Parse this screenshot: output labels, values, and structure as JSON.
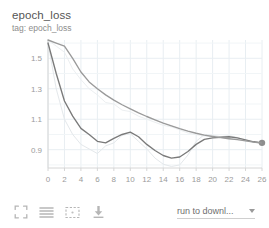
{
  "header": {
    "title": "epoch_loss",
    "subtitle": "tag: epoch_loss"
  },
  "toolbar": {
    "fullscreen_label": "fullscreen-icon",
    "lines_label": "horizontal-lines-icon",
    "fit_label": "fit-domain-icon",
    "download_label": "download-icon",
    "run_selector_label": "run to downl...",
    "caret_label": "chevron-down-icon"
  },
  "colors": {
    "series_dark": "#7a7a7a",
    "series_light": "#9a9a9a",
    "unsmoothed": "#e2e6ea",
    "grid": "#e8eef2",
    "axis_text": "#9b9b9b",
    "title": "#555555",
    "subtitle": "#8d8d8d"
  },
  "chart_data": {
    "type": "line",
    "title": "epoch_loss",
    "xlabel": "",
    "ylabel": "",
    "xlim": [
      0,
      26
    ],
    "ylim": [
      0.78,
      1.62
    ],
    "grid": true,
    "legend_position": "none",
    "xticks": [
      0,
      2,
      4,
      6,
      8,
      10,
      12,
      14,
      16,
      18,
      20,
      22,
      24,
      26
    ],
    "yticks": [
      0.9,
      1.1,
      1.3,
      1.5
    ],
    "x": [
      0,
      1,
      2,
      3,
      4,
      5,
      6,
      7,
      8,
      9,
      10,
      11,
      12,
      13,
      14,
      15,
      16,
      17,
      18,
      19,
      20,
      21,
      22,
      23,
      24,
      25,
      26
    ],
    "series": [
      {
        "name": "train",
        "color": "#7a7a7a",
        "smoothed": true,
        "endpoint_marker": true,
        "values": [
          1.6,
          1.4,
          1.22,
          1.12,
          1.04,
          1.0,
          0.955,
          0.945,
          0.975,
          1.0,
          1.015,
          0.985,
          0.935,
          0.895,
          0.862,
          0.845,
          0.852,
          0.888,
          0.935,
          0.968,
          0.978,
          0.982,
          0.985,
          0.978,
          0.965,
          0.952,
          0.945
        ]
      },
      {
        "name": "validation",
        "color": "#9a9a9a",
        "smoothed": true,
        "endpoint_marker": false,
        "values": [
          1.62,
          1.6,
          1.58,
          1.5,
          1.41,
          1.345,
          1.3,
          1.26,
          1.225,
          1.195,
          1.168,
          1.142,
          1.118,
          1.096,
          1.075,
          1.056,
          1.038,
          1.022,
          1.008,
          0.996,
          0.987,
          0.979,
          0.972,
          0.966,
          0.958,
          0.95,
          0.944
        ]
      },
      {
        "name": "train-unsmoothed",
        "color": "#e4e8eb",
        "smoothed": false,
        "endpoint_marker": false,
        "values": [
          1.6,
          1.3,
          1.1,
          1.0,
          0.935,
          0.905,
          0.875,
          0.925,
          0.945,
          0.995,
          1.005,
          0.955,
          0.905,
          0.845,
          0.805,
          0.79,
          0.8,
          0.865,
          0.955,
          1.0,
          0.995,
          0.985,
          0.992,
          0.98,
          0.96,
          0.948,
          0.942
        ]
      },
      {
        "name": "validation-unsmoothed",
        "color": "#eceff1",
        "smoothed": false,
        "endpoint_marker": false,
        "values": [
          1.62,
          1.58,
          1.54,
          1.43,
          1.36,
          1.3,
          1.26,
          1.21,
          1.2,
          1.16,
          1.15,
          1.12,
          1.1,
          1.08,
          1.06,
          1.05,
          1.03,
          1.01,
          1.0,
          0.99,
          0.99,
          0.98,
          0.97,
          0.97,
          0.96,
          0.95,
          0.944
        ]
      }
    ]
  }
}
